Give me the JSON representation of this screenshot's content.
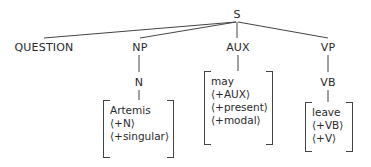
{
  "diagram": {
    "type": "syntax-tree",
    "root": "S",
    "nodes": {
      "s": "S",
      "question": "QUESTION",
      "np": "NP",
      "aux": "AUX",
      "vp": "VP",
      "n": "N",
      "vb": "VB"
    },
    "features": {
      "artemis": [
        "Artemis",
        "⟨+N⟩",
        "⟨+singular⟩"
      ],
      "may": [
        "may",
        "⟨+AUX⟩",
        "⟨+present⟩",
        "⟨+modal⟩"
      ],
      "leave": [
        "leave",
        "⟨+VB⟩",
        "⟨+V⟩"
      ]
    },
    "edges": [
      [
        "S",
        "QUESTION"
      ],
      [
        "S",
        "NP"
      ],
      [
        "S",
        "AUX"
      ],
      [
        "S",
        "VP"
      ],
      [
        "NP",
        "N"
      ],
      [
        "N",
        "Artemis"
      ],
      [
        "AUX",
        "may"
      ],
      [
        "VP",
        "VB"
      ],
      [
        "VB",
        "leave"
      ]
    ],
    "line_color": "#444444",
    "text_color": "#2a2a2a"
  }
}
